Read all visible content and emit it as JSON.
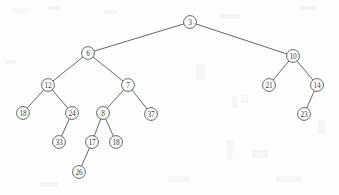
{
  "figure": {
    "kind": "binary-tree-diagram",
    "width": 339,
    "height": 195,
    "background_color": "#fdfdfd",
    "stroke_color": "#56565c",
    "text_color": "#3f3f45",
    "node_radius": 6.4
  },
  "chart_data": {
    "type": "diagram",
    "subtype": "binary-tree",
    "title": "",
    "nodes": [
      {
        "id": "n3",
        "label": "3",
        "x": 190,
        "y": 22,
        "depth": 0
      },
      {
        "id": "n6",
        "label": "6",
        "x": 88,
        "y": 53,
        "depth": 1
      },
      {
        "id": "n10",
        "label": "10",
        "x": 293,
        "y": 56,
        "depth": 1
      },
      {
        "id": "n12",
        "label": "12",
        "x": 48,
        "y": 85,
        "depth": 2
      },
      {
        "id": "n7",
        "label": "7",
        "x": 128,
        "y": 85,
        "depth": 2
      },
      {
        "id": "n21",
        "label": "21",
        "x": 269,
        "y": 85,
        "depth": 2
      },
      {
        "id": "n14",
        "label": "14",
        "x": 317,
        "y": 85,
        "depth": 2
      },
      {
        "id": "n18a",
        "label": "18",
        "x": 23,
        "y": 113,
        "depth": 3
      },
      {
        "id": "n24",
        "label": "24",
        "x": 72,
        "y": 113,
        "depth": 3
      },
      {
        "id": "n8",
        "label": "8",
        "x": 103,
        "y": 113,
        "depth": 3
      },
      {
        "id": "n37",
        "label": "37",
        "x": 151,
        "y": 114,
        "depth": 3
      },
      {
        "id": "n23",
        "label": "23",
        "x": 304,
        "y": 114,
        "depth": 3
      },
      {
        "id": "n33",
        "label": "33",
        "x": 59,
        "y": 142,
        "depth": 4
      },
      {
        "id": "n17",
        "label": "17",
        "x": 92,
        "y": 142,
        "depth": 4
      },
      {
        "id": "n18b",
        "label": "18",
        "x": 116,
        "y": 142,
        "depth": 4
      },
      {
        "id": "n26",
        "label": "26",
        "x": 79,
        "y": 172,
        "depth": 5
      }
    ],
    "edges": [
      {
        "from": "n3",
        "to": "n6",
        "side": "left"
      },
      {
        "from": "n3",
        "to": "n10",
        "side": "right"
      },
      {
        "from": "n6",
        "to": "n12",
        "side": "left"
      },
      {
        "from": "n6",
        "to": "n7",
        "side": "right"
      },
      {
        "from": "n12",
        "to": "n18a",
        "side": "left"
      },
      {
        "from": "n12",
        "to": "n24",
        "side": "right"
      },
      {
        "from": "n24",
        "to": "n33",
        "side": "left"
      },
      {
        "from": "n7",
        "to": "n8",
        "side": "left"
      },
      {
        "from": "n7",
        "to": "n37",
        "side": "right"
      },
      {
        "from": "n8",
        "to": "n17",
        "side": "left"
      },
      {
        "from": "n8",
        "to": "n18b",
        "side": "right"
      },
      {
        "from": "n17",
        "to": "n26",
        "side": "left"
      },
      {
        "from": "n10",
        "to": "n21",
        "side": "left"
      },
      {
        "from": "n10",
        "to": "n14",
        "side": "right"
      },
      {
        "from": "n14",
        "to": "n23",
        "side": "left"
      }
    ]
  }
}
